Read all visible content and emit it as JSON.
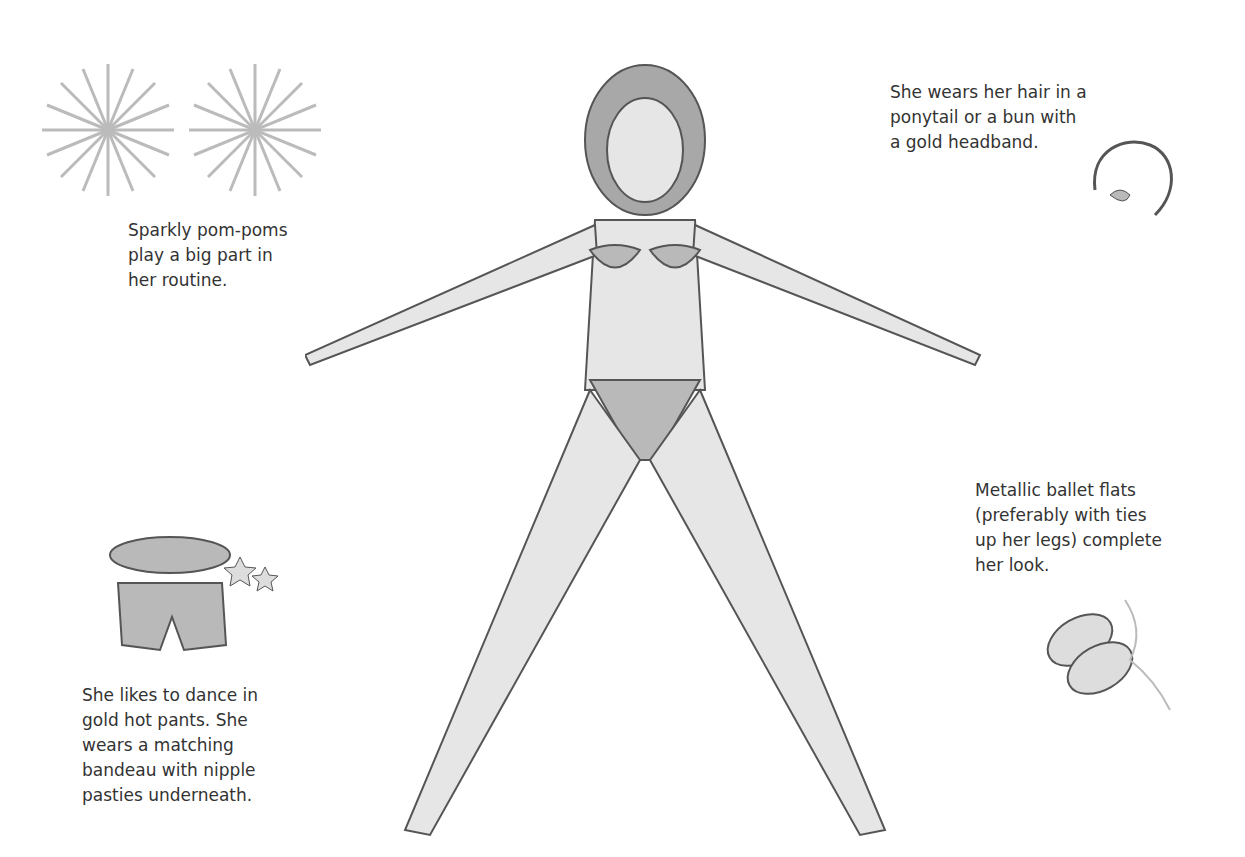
{
  "captions": {
    "pompoms": [
      "Sparkly pom-poms",
      "play a big part in",
      "her routine."
    ],
    "headband": [
      "She wears her hair in a",
      "ponytail or a bun with",
      "a gold headband."
    ],
    "flats": [
      "Metallic ballet flats",
      "(preferably with ties",
      "up her legs) complete",
      "her look."
    ],
    "hotpants": [
      "She likes to dance in",
      "gold hot pants. She",
      "wears a matching",
      "bandeau with nipple",
      "pasties underneath."
    ]
  },
  "colors": {
    "line": "#555555",
    "skin": "#e6e6e6",
    "garment": "#b9b9b9",
    "hair": "#a8a8a8"
  }
}
